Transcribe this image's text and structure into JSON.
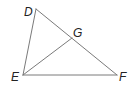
{
  "figure": {
    "type": "triangle-diagram",
    "vertices": [
      "D",
      "E",
      "F",
      "G"
    ],
    "segments": [
      {
        "name": "DE",
        "from": "D",
        "to": "E"
      },
      {
        "name": "DF",
        "from": "D",
        "to": "F"
      },
      {
        "name": "EF",
        "from": "E",
        "to": "F"
      },
      {
        "name": "EG",
        "from": "E",
        "to": "G"
      }
    ],
    "labels": {
      "D": "D",
      "E": "E",
      "F": "F",
      "G": "G"
    }
  }
}
